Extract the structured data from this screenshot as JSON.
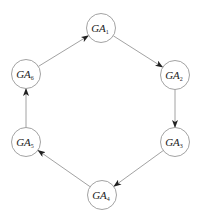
{
  "diagram": {
    "type": "cycle",
    "nodes": [
      {
        "id": "GA1",
        "base": "GA",
        "sub": "1",
        "cx": 101,
        "cy": 28
      },
      {
        "id": "GA2",
        "base": "GA",
        "sub": "2",
        "cx": 175,
        "cy": 75
      },
      {
        "id": "GA3",
        "base": "GA",
        "sub": "3",
        "cx": 175,
        "cy": 142
      },
      {
        "id": "GA4",
        "base": "GA",
        "sub": "4",
        "cx": 102,
        "cy": 195
      },
      {
        "id": "GA5",
        "base": "GA",
        "sub": "5",
        "cx": 26,
        "cy": 142
      },
      {
        "id": "GA6",
        "base": "GA",
        "sub": "6",
        "cx": 26,
        "cy": 74
      }
    ],
    "edges": [
      {
        "from": "GA1",
        "to": "GA2"
      },
      {
        "from": "GA2",
        "to": "GA3"
      },
      {
        "from": "GA3",
        "to": "GA4"
      },
      {
        "from": "GA4",
        "to": "GA5"
      },
      {
        "from": "GA5",
        "to": "GA6"
      },
      {
        "from": "GA6",
        "to": "GA1"
      }
    ],
    "style": {
      "node_radius": 14.5,
      "stroke": "#8a8a8a",
      "edge_stroke": "#8a8a8a",
      "arrow_fill": "#222222"
    }
  }
}
